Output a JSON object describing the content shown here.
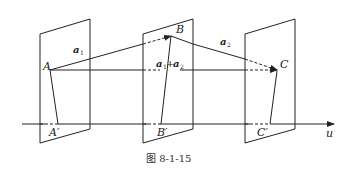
{
  "figure": {
    "caption": "图 8-1-15",
    "axis": {
      "label": "u"
    },
    "points": {
      "A": "A",
      "B": "B",
      "C": "C",
      "A_prime": "A′",
      "B_prime": "B′",
      "C_prime": "C′"
    },
    "vectors": {
      "a1": {
        "base": "a",
        "sub": "1"
      },
      "a2": {
        "base": "a",
        "sub": "2"
      },
      "sum": {
        "base1": "a",
        "sub1": "1",
        "plus": "+",
        "base2": "a",
        "sub2": "2"
      }
    },
    "colors": {
      "stroke": "#222222",
      "background": "#ffffff"
    }
  }
}
